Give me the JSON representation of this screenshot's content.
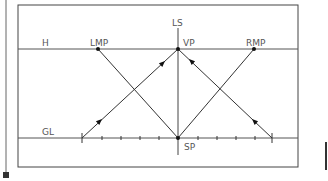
{
  "diagram": {
    "title": "",
    "colors": {
      "frame": "#444444",
      "line": "#333333",
      "label": "#555555",
      "background": "#ffffff"
    },
    "labels": {
      "horizon": "H",
      "ground_line": "GL",
      "left_measuring_point": "LMP",
      "vanishing_point": "VP",
      "right_measuring_point": "RMP",
      "line_of_sight": "LS",
      "station_point": "SP"
    },
    "points": {
      "LMP": [
        98,
        49
      ],
      "VP": [
        178,
        49
      ],
      "RMP": [
        254,
        49
      ],
      "SP": [
        178,
        138
      ],
      "GL_left_end": [
        82,
        138
      ],
      "GL_right_end": [
        272,
        138
      ]
    },
    "ground_line_ticks": [
      102,
      121,
      140,
      159,
      198,
      217,
      236,
      255
    ]
  }
}
